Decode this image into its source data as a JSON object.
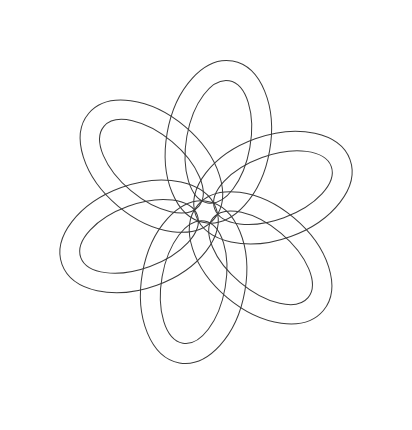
{
  "artwork": {
    "subject": "celtic-knot",
    "style": "line-art",
    "background_color": "#ffffff",
    "stroke_color": "#3a3a3a",
    "band_fill": "#ffffff",
    "loop_count": 6,
    "center": [
      206,
      212
    ],
    "loops": [
      {
        "angle": -20,
        "offset": 95
      },
      {
        "angle": 40,
        "offset": 95
      },
      {
        "angle": 100,
        "offset": 95
      },
      {
        "angle": 160,
        "offset": 95
      },
      {
        "angle": 220,
        "offset": 95
      },
      {
        "angle": 280,
        "offset": 95
      }
    ],
    "outer_rx": 52,
    "outer_ry": 82,
    "band_width": 20
  }
}
